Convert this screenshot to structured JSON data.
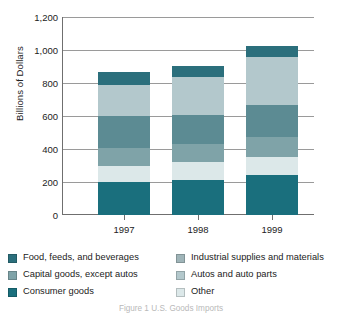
{
  "chart_data": {
    "type": "bar",
    "subtype": "stacked-vertical",
    "title": "",
    "subtitle": "",
    "xlabel": "",
    "ylabel": "Billions of Dollars",
    "categories": [
      "1997",
      "1998",
      "1999"
    ],
    "ylim": [
      0,
      1200
    ],
    "yticks": [
      0,
      200,
      400,
      600,
      800,
      1000,
      1200
    ],
    "ytick_labels": [
      "0",
      "200",
      "400",
      "600",
      "800",
      "1,000",
      "1,200"
    ],
    "grid": true,
    "grid_axis": "y",
    "legend_position": "bottom",
    "stack_order_bottom_to_top": [
      "Consumer goods",
      "Other",
      "Capital goods, except autos",
      "Industrial supplies and materials",
      "Autos and auto parts",
      "Food, feeds, and beverages"
    ],
    "series": [
      {
        "name": "Consumer goods",
        "color": "#1a6f7d",
        "values": [
          200,
          215,
          245
        ]
      },
      {
        "name": "Other",
        "color": "#dce8e9",
        "values": [
          100,
          105,
          110
        ]
      },
      {
        "name": "Capital goods, except autos",
        "color": "#7fa3a8",
        "values": [
          110,
          115,
          120
        ]
      },
      {
        "name": "Industrial supplies and materials",
        "color": "#5c8b93",
        "values": [
          195,
          175,
          195
        ]
      },
      {
        "name": "Autos and auto parts",
        "color": "#b3c8cc",
        "values": [
          190,
          230,
          290
        ]
      },
      {
        "name": "Food, feeds, and beverages",
        "color": "#2b6f7c",
        "values": [
          75,
          70,
          70
        ]
      }
    ],
    "totals": [
      870,
      910,
      1030
    ]
  },
  "axes": {
    "y_title": "Billions of Dollars",
    "y_ticks": [
      {
        "label": "1,200",
        "value": 1200
      },
      {
        "label": "1,000",
        "value": 1000
      },
      {
        "label": "800",
        "value": 800
      },
      {
        "label": "600",
        "value": 600
      },
      {
        "label": "400",
        "value": 400
      },
      {
        "label": "200",
        "value": 200
      },
      {
        "label": "0",
        "value": 0
      }
    ],
    "x_ticks": [
      {
        "label": "1997"
      },
      {
        "label": "1998"
      },
      {
        "label": "1999"
      }
    ]
  },
  "legend": {
    "left_column": [
      {
        "label": "Food, feeds, and beverages",
        "color": "#2b6f7c"
      },
      {
        "label": "Capital goods, except autos",
        "color": "#7fa3a8"
      },
      {
        "label": "Consumer goods",
        "color": "#1a6f7d"
      }
    ],
    "right_column": [
      {
        "label": "Industrial supplies and materials",
        "color": "#9fb4b8"
      },
      {
        "label": "Autos and auto parts",
        "color": "#b3c8cc"
      },
      {
        "label": "Other",
        "color": "#dce8e9"
      }
    ]
  },
  "caption": {
    "text": "Figure 1  U.S. Goods Imports"
  },
  "colors": {
    "gridline": "#9a9a9a",
    "axis": "#6f6f6f",
    "text": "#222222",
    "background": "#ffffff"
  }
}
